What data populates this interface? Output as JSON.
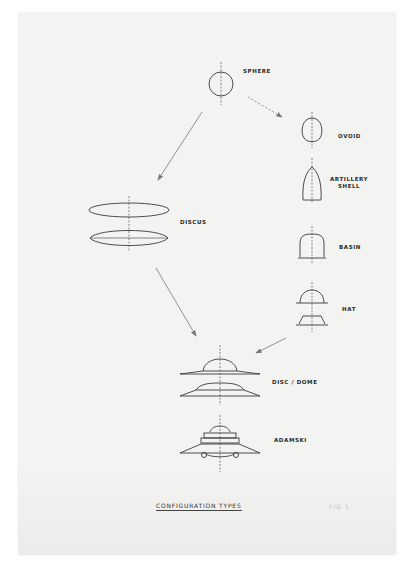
{
  "diagram": {
    "title": "CONFIGURATION TYPES",
    "figure_label": "FIG 1",
    "nodes": [
      {
        "id": "sphere",
        "label": "SPHERE"
      },
      {
        "id": "ovoid",
        "label": "OVOID"
      },
      {
        "id": "artillery_shell",
        "label": "ARTILLERY\nSHELL"
      },
      {
        "id": "basin",
        "label": "BASIN"
      },
      {
        "id": "hat",
        "label": "HAT"
      },
      {
        "id": "discus",
        "label": "DISCUS"
      },
      {
        "id": "disc_dome",
        "label": "DISC / DOME"
      },
      {
        "id": "adamski",
        "label": "ADAMSKI"
      }
    ],
    "edges": [
      {
        "from": "sphere",
        "to": "discus",
        "style": "solid"
      },
      {
        "from": "sphere",
        "to": "ovoid",
        "style": "dashed"
      },
      {
        "from": "discus",
        "to": "disc_dome",
        "style": "solid"
      },
      {
        "from": "hat",
        "to": "disc_dome",
        "style": "solid"
      }
    ],
    "colors": {
      "ink": "#3a3a3a",
      "paper": "#f3f3f1"
    }
  }
}
